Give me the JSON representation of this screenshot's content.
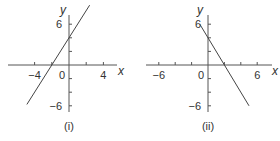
{
  "chart_data": [
    {
      "type": "line",
      "caption": "(i)",
      "xlabel": "x",
      "ylabel": "y",
      "xlim": [
        -7,
        6
      ],
      "ylim": [
        -7,
        8
      ],
      "x_ticks": [
        -4,
        -2,
        2,
        4
      ],
      "x_tick_labels": [
        {
          "value": -4,
          "text": "−4"
        },
        {
          "value": 0,
          "text": "0"
        },
        {
          "value": 4,
          "text": "4"
        }
      ],
      "y_ticks": [
        -6,
        -4,
        -2,
        2,
        4,
        6
      ],
      "y_tick_labels": [
        {
          "value": 6,
          "text": "6"
        },
        {
          "value": -6,
          "text": "−6"
        }
      ],
      "grid": false,
      "series": [
        {
          "name": "line",
          "equation": "y = 2x + 4",
          "x": [
            -4.9,
            2.4
          ],
          "y": [
            -5.8,
            8.8
          ]
        }
      ]
    },
    {
      "type": "line",
      "caption": "(ii)",
      "xlabel": "x",
      "ylabel": "y",
      "xlim": [
        -7.5,
        8
      ],
      "ylim": [
        -7,
        8
      ],
      "x_ticks": [
        -6,
        -4,
        -2,
        2,
        4,
        6
      ],
      "x_tick_labels": [
        {
          "value": -6,
          "text": "−6"
        },
        {
          "value": 0,
          "text": "0"
        },
        {
          "value": 6,
          "text": "6"
        }
      ],
      "y_ticks": [
        -6,
        -4,
        -2,
        2,
        4,
        6
      ],
      "y_tick_labels": [
        {
          "value": 6,
          "text": "6"
        },
        {
          "value": -6,
          "text": "−6"
        }
      ],
      "grid": false,
      "series": [
        {
          "name": "line",
          "equation": "y = -2x + 4",
          "x": [
            -1.0,
            5.0
          ],
          "y": [
            6.0,
            -6.0
          ]
        }
      ]
    }
  ]
}
